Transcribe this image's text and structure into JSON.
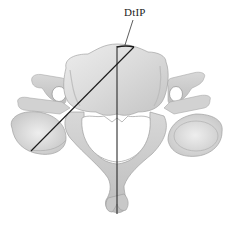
{
  "figure": {
    "annotation": {
      "label": "DtIP"
    },
    "colors": {
      "bone_light": "#e8e8e8",
      "bone_mid": "#c9c9c9",
      "bone_dark": "#9a9a9a",
      "line": "#1a1a1a",
      "background": "#ffffff"
    }
  }
}
